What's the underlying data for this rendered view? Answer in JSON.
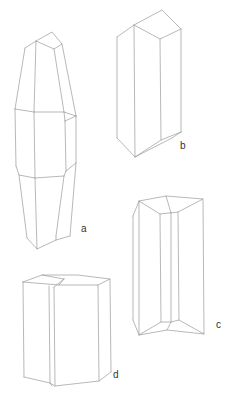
{
  "figure": {
    "type": "crystal habit diagrams",
    "labels": {
      "a": "a",
      "b": "b",
      "c": "c",
      "d": "d"
    },
    "stroke_color": "#9a9a9a",
    "background": "#ffffff"
  }
}
